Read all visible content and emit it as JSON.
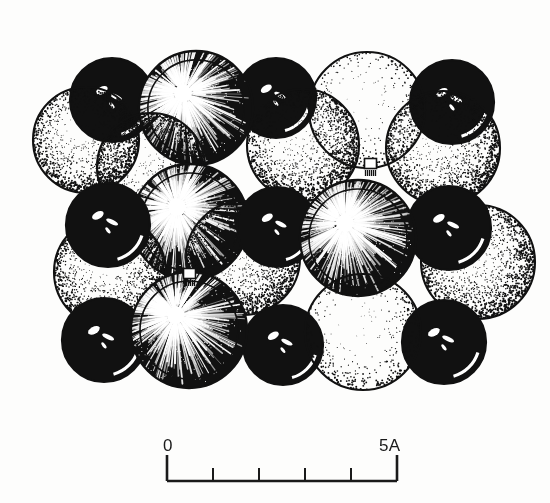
{
  "figure": {
    "kind": "stipple-line-art-illustration",
    "background_color": "#fdfdfc",
    "ink_color": "#111111"
  },
  "scale_bar": {
    "name": "scale-bar",
    "left_label": "0",
    "right_label": "5A",
    "unit": "A",
    "span_value": 5,
    "divisions": 5,
    "tick_count": 4,
    "x_start": 167,
    "x_end": 397,
    "baseline_y": 481,
    "end_tick_height": 26,
    "inner_tick_height": 13,
    "line_color": "#1a1a1a",
    "line_width": 2.6
  },
  "legend_styles": [
    {
      "id": "glossy-black",
      "label": "glossy black sphere",
      "fill": "#090909",
      "highlight": "specular-streaks"
    },
    {
      "id": "starburst-dark",
      "label": "dark sphere with radiating highlight",
      "fill": "#0d0d0d",
      "highlight": "radial-burst"
    },
    {
      "id": "medium-stipple",
      "label": "medium stipple sphere",
      "fill": "#ffffff",
      "highlight": "stipple-gradient"
    },
    {
      "id": "light-stipple",
      "label": "light stipple sphere",
      "fill": "#ffffff",
      "highlight": "sparse-stipple"
    }
  ],
  "markers": [
    {
      "id": "contact-marker-1",
      "x": 364,
      "y": 158,
      "w": 13,
      "h": 11,
      "label": "white square contact marker"
    },
    {
      "id": "contact-marker-2",
      "x": 183,
      "y": 268,
      "w": 13,
      "h": 11,
      "label": "white square contact marker"
    }
  ],
  "spheres": [
    {
      "id": "s01",
      "style": "glossy-black",
      "cx": 112,
      "cy": 100,
      "r": 42,
      "z": 1
    },
    {
      "id": "s02",
      "style": "glossy-black",
      "cx": 276,
      "cy": 98,
      "r": 40,
      "z": 1
    },
    {
      "id": "s03",
      "style": "glossy-black",
      "cx": 452,
      "cy": 102,
      "r": 42,
      "z": 1
    },
    {
      "id": "s04",
      "style": "medium-stipple",
      "cx": 86,
      "cy": 140,
      "r": 53,
      "z": 2
    },
    {
      "id": "s05",
      "style": "starburst-dark",
      "cx": 196,
      "cy": 108,
      "r": 57,
      "z": 3
    },
    {
      "id": "s06",
      "style": "light-stipple",
      "cx": 367,
      "cy": 110,
      "r": 58,
      "z": 2
    },
    {
      "id": "s07",
      "style": "medium-stipple",
      "cx": 303,
      "cy": 145,
      "r": 56,
      "z": 3
    },
    {
      "id": "s08",
      "style": "medium-stipple",
      "cx": 443,
      "cy": 148,
      "r": 57,
      "z": 3
    },
    {
      "id": "s09",
      "style": "medium-stipple",
      "cx": 151,
      "cy": 167,
      "r": 54,
      "z": 4
    },
    {
      "id": "s10",
      "style": "glossy-black",
      "cx": 108,
      "cy": 225,
      "r": 42,
      "z": 6
    },
    {
      "id": "s11",
      "style": "glossy-black",
      "cx": 277,
      "cy": 227,
      "r": 40,
      "z": 6
    },
    {
      "id": "s12",
      "style": "glossy-black",
      "cx": 449,
      "cy": 228,
      "r": 42,
      "z": 6
    },
    {
      "id": "s13",
      "style": "starburst-dark",
      "cx": 190,
      "cy": 222,
      "r": 58,
      "z": 5
    },
    {
      "id": "s14",
      "style": "medium-stipple",
      "cx": 110,
      "cy": 272,
      "r": 56,
      "z": 5
    },
    {
      "id": "s15",
      "style": "medium-stipple",
      "cx": 243,
      "cy": 258,
      "r": 57,
      "z": 5
    },
    {
      "id": "s16",
      "style": "starburst-dark",
      "cx": 358,
      "cy": 238,
      "r": 58,
      "z": 7
    },
    {
      "id": "s17",
      "style": "medium-stipple",
      "cx": 478,
      "cy": 262,
      "r": 57,
      "z": 5
    },
    {
      "id": "s18",
      "style": "glossy-black",
      "cx": 104,
      "cy": 340,
      "r": 42,
      "z": 8
    },
    {
      "id": "s19",
      "style": "glossy-black",
      "cx": 283,
      "cy": 345,
      "r": 40,
      "z": 8
    },
    {
      "id": "s20",
      "style": "glossy-black",
      "cx": 444,
      "cy": 342,
      "r": 42,
      "z": 8
    },
    {
      "id": "s21",
      "style": "starburst-dark",
      "cx": 189,
      "cy": 330,
      "r": 58,
      "z": 9
    },
    {
      "id": "s22",
      "style": "light-stipple",
      "cx": 363,
      "cy": 332,
      "r": 58,
      "z": 9
    }
  ]
}
